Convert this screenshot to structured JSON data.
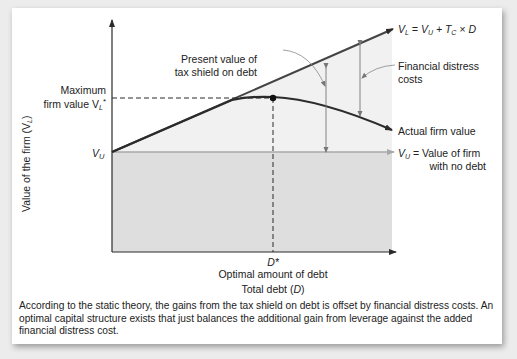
{
  "diagram": {
    "y_axis_label": "Value of the firm (V",
    "y_axis_label_sub": "L",
    "y_axis_label_end": ")",
    "x_axis_label": "Total debt (",
    "x_axis_label_var": "D",
    "x_axis_label_end": ")",
    "max_value_label_line1": "Maximum",
    "max_value_label_line2": "firm value V",
    "max_value_label_sub": "L",
    "max_value_label_sup": "*",
    "vu_tick_label": "V",
    "vu_tick_label_sub": "U",
    "d_star_label": "D*",
    "d_star_caption": "Optimal amount of debt",
    "pv_tax_shield_line1": "Present value of",
    "pv_tax_shield_line2": "tax shield on debt",
    "vl_formula": {
      "v": "V",
      "v_sub": "L",
      "eq": " = V",
      "vu_sub": "U",
      "plus": " + T",
      "tc_sub": "C",
      "rest": " × D"
    },
    "financial_distress_line1": "Financial distress",
    "financial_distress_line2": "costs",
    "actual_value_label": "Actual firm value",
    "vu_legend_line1_prefix": "V",
    "vu_legend_line1_sub": "U",
    "vu_legend_line1_rest": " = Value of firm",
    "vu_legend_line2": "with no debt",
    "colors": {
      "line_dark": "#2b2b2b",
      "vu_line": "#a8a8a8",
      "shade_below_vu": "#dcdcdc",
      "shade_between": "#f0f0f0"
    }
  },
  "caption": "According to the static theory, the gains from the tax shield on debt is offset by financial distress costs. An optimal capital structure exists that just balances the additional gain from leverage against the added financial distress cost."
}
